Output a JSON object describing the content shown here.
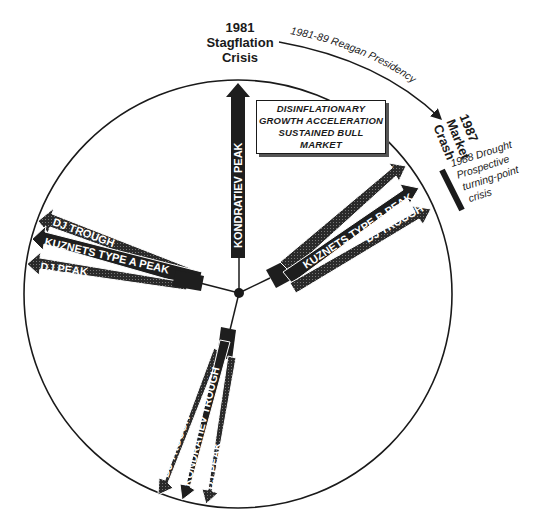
{
  "diagram": {
    "type": "cycle-wheel",
    "circle": {
      "cx": 238,
      "cy": 294,
      "r": 214,
      "stroke": "#1a1a1a"
    },
    "hub": {
      "cx": 239,
      "cy": 293
    },
    "top_label": {
      "year": "1981",
      "line1": "Stagflation",
      "line2": "Crisis"
    },
    "reagan_arc": {
      "label": "1981-89 Reagan Presidency"
    },
    "crash_label": {
      "year": "1987",
      "line1": "Market",
      "line2": "Crash"
    },
    "drought_label": {
      "line1": "1988 Drought",
      "line2": "Prospective",
      "line3": "turning-point",
      "line4": "crisis"
    },
    "center_box": {
      "line1": "DISINFLATIONARY",
      "line2": "GROWTH ACCELERATION",
      "line3": "SUSTAINED BULL",
      "line4": "MARKET"
    },
    "arrows": {
      "top": {
        "label": "KONDRATIEV PEAK"
      },
      "right": [
        {
          "label": "DJ PEAK"
        },
        {
          "label": "KUZNETS TYPE B PEAK"
        },
        {
          "label": "DJ TROUGH"
        }
      ],
      "left": [
        {
          "label": "DJ TROUGH"
        },
        {
          "label": "KUZNETS TYPE A PEAK"
        },
        {
          "label": "DJ PEAK"
        }
      ],
      "bottom": [
        {
          "label": "DJ TROUGH"
        },
        {
          "label": "KONDRATIEV TROUGH"
        },
        {
          "label": "DJ PEAK"
        }
      ]
    },
    "colors": {
      "ink": "#1a1a1a",
      "arrow_fill": "#222222",
      "background": "#ffffff"
    }
  }
}
